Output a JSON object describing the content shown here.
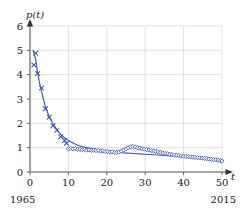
{
  "chart_data": {
    "type": "line",
    "title": "",
    "xlabel": "t",
    "ylabel": "p(t)",
    "xlim": [
      0,
      50
    ],
    "ylim": [
      0,
      6
    ],
    "grid": true,
    "legend": null,
    "x_ticks": [
      0,
      10,
      20,
      30,
      40,
      50
    ],
    "x_tick_labels": [
      "0",
      "10",
      "20",
      "30",
      "40",
      "50"
    ],
    "y_ticks": [
      0,
      1,
      2,
      3,
      4,
      5,
      6
    ],
    "y_tick_labels": [
      "0",
      "1",
      "2",
      "3",
      "4",
      "5",
      "6"
    ],
    "x_axis_start_annotation": "1965",
    "x_axis_end_annotation": "2015",
    "series_color": "#4257b2",
    "marker_early_style": "cross",
    "marker_late_style": "diamond",
    "series": [
      {
        "name": "observed",
        "marker_data": [
          {
            "x": 1.0,
            "y": 4.4
          },
          {
            "x": 1.5,
            "y": 4.88
          },
          {
            "x": 2.0,
            "y": 4.05
          },
          {
            "x": 3.0,
            "y": 3.45
          },
          {
            "x": 4.0,
            "y": 2.6
          },
          {
            "x": 5.0,
            "y": 2.25
          },
          {
            "x": 6.0,
            "y": 1.9
          },
          {
            "x": 7.0,
            "y": 1.72
          },
          {
            "x": 8.0,
            "y": 1.45
          },
          {
            "x": 9.0,
            "y": 1.3
          },
          {
            "x": 9.5,
            "y": 1.18
          },
          {
            "x": 10.0,
            "y": 0.95
          },
          {
            "x": 10.6,
            "y": 0.97
          },
          {
            "x": 11.2,
            "y": 0.95
          },
          {
            "x": 11.8,
            "y": 0.96
          },
          {
            "x": 12.4,
            "y": 0.93
          },
          {
            "x": 13.0,
            "y": 0.94
          },
          {
            "x": 13.6,
            "y": 0.92
          },
          {
            "x": 14.2,
            "y": 0.93
          },
          {
            "x": 14.8,
            "y": 0.9
          },
          {
            "x": 15.4,
            "y": 0.91
          },
          {
            "x": 16.0,
            "y": 0.89
          },
          {
            "x": 16.6,
            "y": 0.9
          },
          {
            "x": 17.2,
            "y": 0.88
          },
          {
            "x": 17.8,
            "y": 0.89
          },
          {
            "x": 18.4,
            "y": 0.86
          },
          {
            "x": 19.0,
            "y": 0.87
          },
          {
            "x": 19.6,
            "y": 0.84
          },
          {
            "x": 20.2,
            "y": 0.85
          },
          {
            "x": 20.8,
            "y": 0.82
          },
          {
            "x": 21.4,
            "y": 0.83
          },
          {
            "x": 22.0,
            "y": 0.8
          },
          {
            "x": 22.6,
            "y": 0.81
          },
          {
            "x": 23.2,
            "y": 0.83
          },
          {
            "x": 23.8,
            "y": 0.86
          },
          {
            "x": 24.4,
            "y": 0.9
          },
          {
            "x": 25.0,
            "y": 0.95
          },
          {
            "x": 25.6,
            "y": 1.0
          },
          {
            "x": 26.2,
            "y": 1.04
          },
          {
            "x": 26.8,
            "y": 1.05
          },
          {
            "x": 27.4,
            "y": 1.03
          },
          {
            "x": 28.0,
            "y": 1.0
          },
          {
            "x": 28.6,
            "y": 0.98
          },
          {
            "x": 29.2,
            "y": 0.96
          },
          {
            "x": 29.8,
            "y": 0.94
          },
          {
            "x": 30.4,
            "y": 0.92
          },
          {
            "x": 31.0,
            "y": 0.9
          },
          {
            "x": 31.6,
            "y": 0.88
          },
          {
            "x": 32.2,
            "y": 0.86
          },
          {
            "x": 32.8,
            "y": 0.84
          },
          {
            "x": 33.4,
            "y": 0.82
          },
          {
            "x": 34.0,
            "y": 0.8
          },
          {
            "x": 34.6,
            "y": 0.78
          },
          {
            "x": 35.2,
            "y": 0.76
          },
          {
            "x": 35.8,
            "y": 0.75
          },
          {
            "x": 36.4,
            "y": 0.73
          },
          {
            "x": 37.0,
            "y": 0.72
          },
          {
            "x": 37.6,
            "y": 0.7
          },
          {
            "x": 38.2,
            "y": 0.69
          },
          {
            "x": 38.8,
            "y": 0.68
          },
          {
            "x": 39.4,
            "y": 0.66
          },
          {
            "x": 40.0,
            "y": 0.65
          },
          {
            "x": 40.6,
            "y": 0.64
          },
          {
            "x": 41.2,
            "y": 0.63
          },
          {
            "x": 41.8,
            "y": 0.62
          },
          {
            "x": 42.4,
            "y": 0.61
          },
          {
            "x": 43.0,
            "y": 0.6
          },
          {
            "x": 43.6,
            "y": 0.59
          },
          {
            "x": 44.2,
            "y": 0.58
          },
          {
            "x": 44.8,
            "y": 0.57
          },
          {
            "x": 45.4,
            "y": 0.56
          },
          {
            "x": 46.0,
            "y": 0.55
          },
          {
            "x": 46.6,
            "y": 0.53
          },
          {
            "x": 47.2,
            "y": 0.52
          },
          {
            "x": 47.8,
            "y": 0.51
          },
          {
            "x": 48.4,
            "y": 0.5
          },
          {
            "x": 49.0,
            "y": 0.48
          },
          {
            "x": 49.6,
            "y": 0.47
          },
          {
            "x": 50.0,
            "y": 0.45
          }
        ]
      },
      {
        "name": "fitted-curve",
        "curve_data": [
          {
            "x": 0.8,
            "y": 5.0
          },
          {
            "x": 1.5,
            "y": 4.6
          },
          {
            "x": 2.0,
            "y": 4.05
          },
          {
            "x": 3.0,
            "y": 3.3
          },
          {
            "x": 4.0,
            "y": 2.7
          },
          {
            "x": 5.0,
            "y": 2.28
          },
          {
            "x": 6.0,
            "y": 1.98
          },
          {
            "x": 7.0,
            "y": 1.74
          },
          {
            "x": 8.0,
            "y": 1.55
          },
          {
            "x": 9.0,
            "y": 1.41
          },
          {
            "x": 10.0,
            "y": 1.29
          },
          {
            "x": 12.0,
            "y": 1.13
          },
          {
            "x": 14.0,
            "y": 1.03
          },
          {
            "x": 16.0,
            "y": 0.96
          },
          {
            "x": 18.0,
            "y": 0.9
          },
          {
            "x": 20.0,
            "y": 0.86
          },
          {
            "x": 22.0,
            "y": 0.82
          },
          {
            "x": 24.0,
            "y": 0.79
          },
          {
            "x": 26.0,
            "y": 0.77
          },
          {
            "x": 28.0,
            "y": 0.75
          },
          {
            "x": 30.0,
            "y": 0.73
          },
          {
            "x": 33.0,
            "y": 0.7
          },
          {
            "x": 36.0,
            "y": 0.67
          },
          {
            "x": 39.0,
            "y": 0.64
          },
          {
            "x": 42.0,
            "y": 0.6
          },
          {
            "x": 45.0,
            "y": 0.56
          },
          {
            "x": 48.0,
            "y": 0.51
          },
          {
            "x": 50.0,
            "y": 0.47
          }
        ]
      }
    ]
  }
}
